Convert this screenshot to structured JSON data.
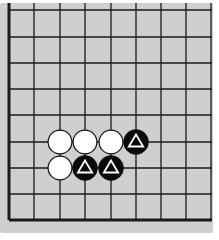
{
  "diagram": {
    "type": "go-board-corner",
    "board": {
      "background_color": "#cfcfcf",
      "line_color": "#1a1a1a",
      "columns": 9,
      "rows": 9,
      "x_lines": [
        9,
        34,
        60,
        85,
        111,
        136,
        161,
        186,
        211
      ],
      "y_lines": [
        10,
        37,
        63,
        89,
        115,
        142,
        168,
        194,
        220
      ],
      "thick_edges": [
        "left",
        "bottom"
      ],
      "open_edges": [
        "top",
        "right"
      ],
      "area": {
        "x": 0,
        "y": 3,
        "width": 213,
        "height": 230
      }
    },
    "stones": [
      {
        "color": "white",
        "col": 2,
        "row": 5,
        "marker": null
      },
      {
        "color": "white",
        "col": 3,
        "row": 5,
        "marker": null
      },
      {
        "color": "white",
        "col": 4,
        "row": 5,
        "marker": null
      },
      {
        "color": "black",
        "col": 5,
        "row": 5,
        "marker": "triangle"
      },
      {
        "color": "white",
        "col": 2,
        "row": 6,
        "marker": null
      },
      {
        "color": "black",
        "col": 3,
        "row": 6,
        "marker": "triangle"
      },
      {
        "color": "black",
        "col": 4,
        "row": 6,
        "marker": "triangle"
      }
    ],
    "stone_radius": 12.5,
    "colors": {
      "black_stone": "#0a0a0a",
      "white_stone": "#ffffff",
      "white_outline": "#111111",
      "triangle_marker_on_black": "#ffffff"
    }
  }
}
